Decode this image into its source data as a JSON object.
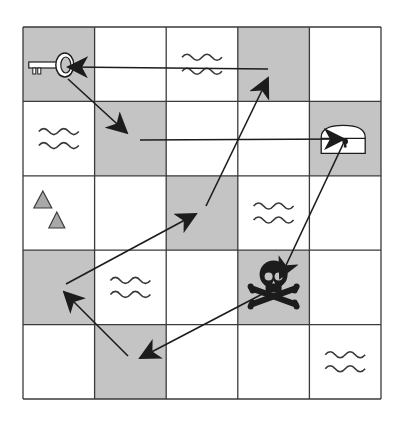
{
  "grid": {
    "rows": 5,
    "cols": 5,
    "x0": 23,
    "y0": 27,
    "x1": 381,
    "y1": 399,
    "colors": {
      "shaded": "#c4c4c4",
      "plain": "#ffffff",
      "line": "#3a3a3a",
      "ink": "#1c1c1c",
      "triangle": "#a8a8a8"
    },
    "cells": [
      [
        {
          "shade": true,
          "icon": "key"
        },
        {
          "shade": false,
          "icon": ""
        },
        {
          "shade": false,
          "icon": "water"
        },
        {
          "shade": true,
          "icon": ""
        },
        {
          "shade": false,
          "icon": ""
        }
      ],
      [
        {
          "shade": false,
          "icon": "water"
        },
        {
          "shade": true,
          "icon": ""
        },
        {
          "shade": false,
          "icon": ""
        },
        {
          "shade": false,
          "icon": ""
        },
        {
          "shade": true,
          "icon": "chest"
        }
      ],
      [
        {
          "shade": false,
          "icon": "mountains"
        },
        {
          "shade": false,
          "icon": ""
        },
        {
          "shade": true,
          "icon": ""
        },
        {
          "shade": false,
          "icon": "water"
        },
        {
          "shade": false,
          "icon": ""
        }
      ],
      [
        {
          "shade": true,
          "icon": ""
        },
        {
          "shade": false,
          "icon": "water"
        },
        {
          "shade": false,
          "icon": ""
        },
        {
          "shade": true,
          "icon": "skull"
        },
        {
          "shade": false,
          "icon": ""
        }
      ],
      [
        {
          "shade": false,
          "icon": ""
        },
        {
          "shade": true,
          "icon": ""
        },
        {
          "shade": false,
          "icon": ""
        },
        {
          "shade": false,
          "icon": ""
        },
        {
          "shade": false,
          "icon": "water"
        }
      ]
    ]
  },
  "path": {
    "description": "Route: chest -> skull -> (row5,col2) -> (row4,col1) -> (row3,col3) -> (row1,col4) -> key -> (row2,col2) -> chest",
    "arrows": [
      {
        "from": [
          345,
          140
        ],
        "to": [
          280,
          278
        ]
      },
      {
        "from": [
          270,
          290
        ],
        "to": [
          140,
          358
        ]
      },
      {
        "from": [
          128,
          356
        ],
        "to": [
          64,
          292
        ]
      },
      {
        "from": [
          66,
          284
        ],
        "to": [
          196,
          214
        ]
      },
      {
        "from": [
          206,
          206
        ],
        "to": [
          268,
          78
        ]
      },
      {
        "from": [
          268,
          69
        ],
        "to": [
          68,
          67
        ]
      },
      {
        "from": [
          68,
          79
        ],
        "to": [
          127,
          133
        ]
      },
      {
        "from": [
          140,
          140
        ],
        "to": [
          344,
          139
        ]
      }
    ]
  }
}
